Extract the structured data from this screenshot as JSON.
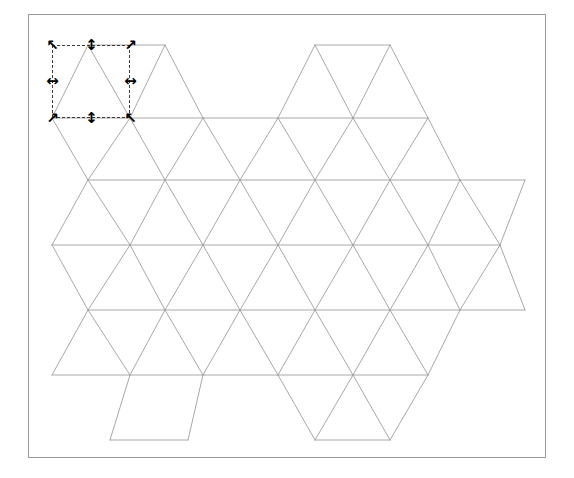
{
  "app": {
    "title": "Triangular Lattice Canvas",
    "background_color": "#ffffff"
  },
  "canvas": {
    "name": "drawing-canvas",
    "border_color": "#9a9a9a",
    "background_color": "#ffffff",
    "x": 28,
    "y": 14,
    "width": 518,
    "height": 444
  },
  "drawing": {
    "type": "triangular-lattice",
    "stroke_color": "#9e9e9e",
    "stroke_width": 0.9,
    "cell_width": 75,
    "row_height": 65,
    "origin_x": 88,
    "origin_y": 45,
    "rows": 7,
    "columns": 7,
    "description": "Hexagonal arrangement of equilateral triangles forming a triangular lattice grid"
  },
  "selection": {
    "name": "selection-bounding-box",
    "visible": true,
    "stroke_color": "#3a3a3a",
    "stroke_style": "dashed",
    "x": 52,
    "y": 45,
    "width": 78,
    "height": 73,
    "handle_count": 8,
    "handles": [
      {
        "id": "nw",
        "icon": "resize-nwse-icon",
        "glyph": "↖",
        "x": 52,
        "y": 45,
        "cursor": "nwse-resize"
      },
      {
        "id": "n",
        "icon": "resize-ns-icon",
        "glyph": "↕",
        "x": 91,
        "y": 45,
        "cursor": "ns-resize"
      },
      {
        "id": "ne",
        "icon": "resize-nesw-icon",
        "glyph": "↗",
        "x": 130,
        "y": 45,
        "cursor": "nesw-resize"
      },
      {
        "id": "w",
        "icon": "resize-ew-icon",
        "glyph": "↔",
        "x": 52,
        "y": 81,
        "cursor": "ew-resize"
      },
      {
        "id": "e",
        "icon": "resize-ew-icon",
        "glyph": "↔",
        "x": 130,
        "y": 81,
        "cursor": "ew-resize"
      },
      {
        "id": "sw",
        "icon": "resize-nesw-icon",
        "glyph": "↗",
        "x": 52,
        "y": 118,
        "cursor": "nesw-resize"
      },
      {
        "id": "s",
        "icon": "resize-ns-icon",
        "glyph": "↕",
        "x": 91,
        "y": 118,
        "cursor": "ns-resize"
      },
      {
        "id": "se",
        "icon": "resize-nwse-icon",
        "glyph": "↖",
        "x": 130,
        "y": 118,
        "cursor": "nwse-resize"
      }
    ]
  },
  "chart_data": {
    "type": "table",
    "title": "",
    "lattice_rows": [
      {
        "row": 0,
        "y": 45,
        "vertices_x": [
          88,
          165,
          315,
          390
        ]
      },
      {
        "row": 1,
        "y": 118,
        "vertices_x": [
          52,
          130,
          203,
          278,
          353,
          428
        ]
      },
      {
        "row": 2,
        "y": 180,
        "vertices_x": [
          88,
          165,
          240,
          315,
          390,
          460,
          525
        ]
      },
      {
        "row": 3,
        "y": 245,
        "vertices_x": [
          52,
          130,
          203,
          278,
          353,
          428,
          500
        ]
      },
      {
        "row": 4,
        "y": 310,
        "vertices_x": [
          88,
          165,
          240,
          315,
          390,
          460,
          525
        ]
      },
      {
        "row": 5,
        "y": 375,
        "vertices_x": [
          52,
          130,
          203,
          278,
          353,
          428
        ]
      },
      {
        "row": 6,
        "y": 440,
        "vertices_x": [
          110,
          188,
          315,
          390
        ]
      }
    ]
  }
}
